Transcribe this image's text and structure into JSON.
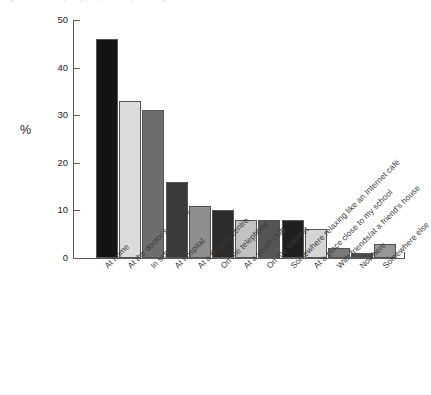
{
  "figure": {
    "caption_remnant": "Figure 3.2  Where young people would prefer to get information and advice about health",
    "y_axis_title": "%"
  },
  "chart_data": {
    "type": "bar",
    "title": "",
    "xlabel": "",
    "ylabel": "%",
    "ylim": [
      0,
      50
    ],
    "yticks": [
      0,
      10,
      20,
      30,
      40,
      50
    ],
    "grid": false,
    "legend": "none",
    "categories": [
      "At home",
      "At the doctor's surgery",
      "In school",
      "At hospital",
      "At a drop-in centre",
      "On the telephone",
      "At a youth club",
      "On the Internet",
      "Somewhere relaxing like an Internet café",
      "At a place close to my school",
      "With friends/at a friend's house",
      "Nowhere",
      "Somewhere else"
    ],
    "values": [
      46,
      33,
      31,
      16,
      11,
      10,
      8,
      8,
      8,
      6,
      2,
      1,
      3
    ],
    "bar_colors": [
      "#141414",
      "#dcdcdc",
      "#6e6e6e",
      "#3a3a3a",
      "#8e8e8e",
      "#2b2b2b",
      "#c2c2c2",
      "#555555",
      "#1f1f1f",
      "#d5d5d5",
      "#787878",
      "#4a4a4a",
      "#969696"
    ]
  }
}
